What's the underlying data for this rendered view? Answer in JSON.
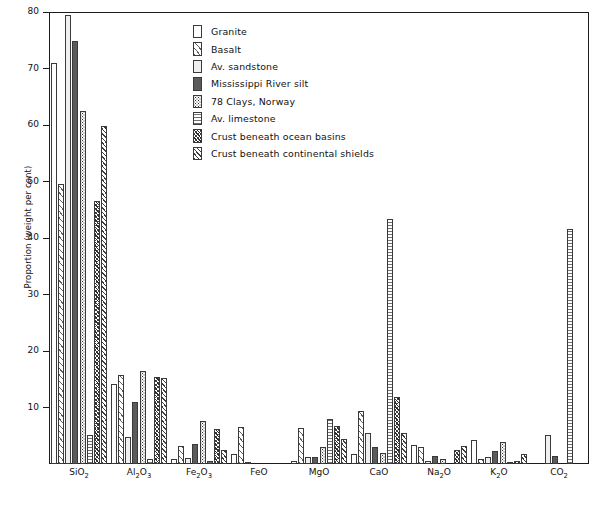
{
  "chart_data": {
    "type": "bar",
    "title": "",
    "xlabel": "",
    "ylabel": "Proportion (weight per cent)",
    "ylim": [
      0,
      80
    ],
    "ytick_values": [
      0,
      10,
      20,
      30,
      40,
      50,
      60,
      70,
      80
    ],
    "ytick_labels": [
      "0",
      "10",
      "20",
      "30",
      "40",
      "50",
      "60",
      "70",
      "80"
    ],
    "grid": false,
    "legend_position": "upper-center",
    "categories": [
      "SiO2",
      "Al2O3",
      "Fe2O3",
      "FeO",
      "MgO",
      "CaO",
      "Na2O",
      "K2O",
      "CO2"
    ],
    "category_labels_html": [
      "SiO<sub>2</sub>",
      "Al<sub>2</sub>O<sub>3</sub>",
      "Fe<sub>2</sub>O<sub>3</sub>",
      "FeO",
      "MgO",
      "CaO",
      "Na<sub>2</sub>O",
      "K<sub>2</sub>O",
      "CO<sub>2</sub>"
    ],
    "series": [
      {
        "name": "Granite",
        "pattern": "granite",
        "values": [
          71.0,
          14.2,
          0.9,
          1.7,
          0.5,
          1.8,
          3.4,
          4.3,
          0.0
        ]
      },
      {
        "name": "Basalt",
        "pattern": "basalt",
        "values": [
          49.5,
          15.7,
          3.2,
          6.5,
          6.3,
          9.4,
          3.1,
          0.9,
          0.0
        ]
      },
      {
        "name": "Av. sandstone",
        "pattern": "sandstone",
        "values": [
          79.5,
          4.8,
          1.1,
          0.3,
          1.2,
          5.5,
          0.5,
          1.3,
          5.2
        ]
      },
      {
        "name": "Mississippi River silt",
        "pattern": "silt",
        "values": [
          74.8,
          11.0,
          3.5,
          0.0,
          1.3,
          3.0,
          1.4,
          2.3,
          1.4
        ]
      },
      {
        "name": "78 Clays, Norway",
        "pattern": "clays",
        "values": [
          62.5,
          16.4,
          7.7,
          0.0,
          3.1,
          2.0,
          0.9,
          3.9,
          0.0
        ]
      },
      {
        "name": "Av. limestone",
        "pattern": "limestone",
        "values": [
          5.2,
          0.8,
          0.5,
          0.0,
          7.9,
          43.4,
          0.0,
          0.3,
          41.6
        ]
      },
      {
        "name": "Crust beneath ocean basins",
        "pattern": "ocean",
        "values": [
          46.5,
          15.4,
          6.2,
          0.0,
          6.8,
          11.8,
          2.4,
          0.6,
          0.0
        ]
      },
      {
        "name": "Crust beneath continental shields",
        "pattern": "continental",
        "values": [
          59.8,
          15.2,
          2.4,
          0.0,
          4.5,
          5.5,
          3.2,
          1.8,
          0.0
        ]
      }
    ]
  }
}
